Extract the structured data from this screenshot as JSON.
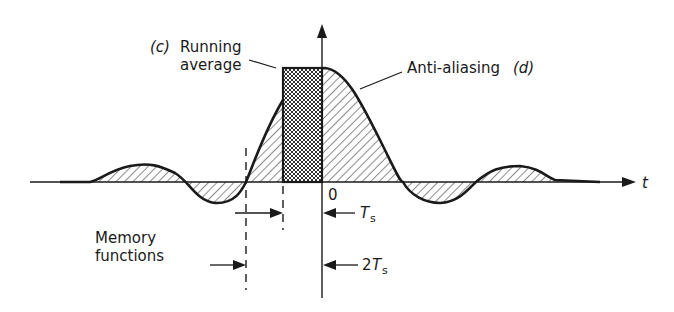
{
  "diagram": {
    "labels": {
      "running_average_prefix": "(c)",
      "running_average_line1": "Running",
      "running_average_line2": "average",
      "anti_aliasing": "Anti-aliasing",
      "anti_aliasing_suffix": "(d)",
      "origin": "0",
      "t_axis": "t",
      "ts": "T",
      "ts_sub": "s",
      "two_ts_coef": "2",
      "two_ts": "T",
      "two_ts_sub": "s",
      "memory_line1": "Memory",
      "memory_line2": "functions"
    },
    "colors": {
      "ink": "#1a1a1a",
      "background": "#ffffff"
    }
  }
}
